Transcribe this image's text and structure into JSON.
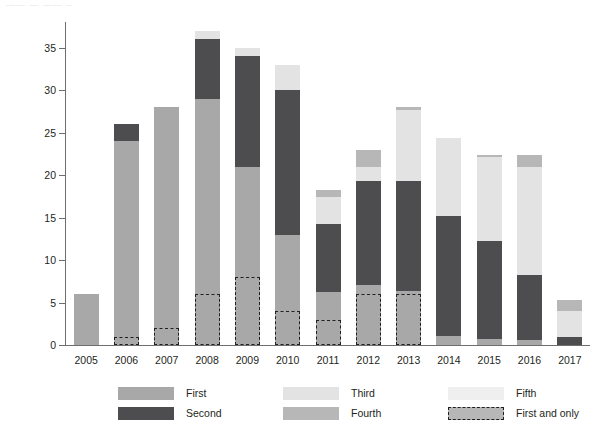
{
  "top_artifact": "—— — ——  ——",
  "axes": {
    "ylabel": "Number of assessments",
    "yticks": [
      0,
      5,
      10,
      15,
      20,
      25,
      30,
      35
    ],
    "ylim": [
      0,
      38
    ],
    "xlabel": ""
  },
  "colors": {
    "first": "#a8a8a8",
    "second": "#4d4d4f",
    "third": "#e3e3e3",
    "fourth": "#b7b7b7",
    "fifth": "#efefef",
    "first_and_only_border": "#231f20",
    "axis": "#6d6e70",
    "text": "#231f20",
    "background": "#ffffff"
  },
  "legend": {
    "items": [
      {
        "label": "First",
        "key": "first",
        "style": "solid"
      },
      {
        "label": "Second",
        "key": "second",
        "style": "solid"
      },
      {
        "label": "Third",
        "key": "third",
        "style": "solid"
      },
      {
        "label": "Fourth",
        "key": "fourth",
        "style": "solid"
      },
      {
        "label": "Fifth",
        "key": "fifth",
        "style": "solid"
      },
      {
        "label": "First and only",
        "key": "fourth",
        "style": "dashed"
      }
    ]
  },
  "chart_data": {
    "type": "bar",
    "subtype": "stacked",
    "title": "",
    "xlabel": "",
    "ylabel": "Number of assessments",
    "ylim": [
      0,
      38
    ],
    "yticks": [
      0,
      5,
      10,
      15,
      20,
      25,
      30,
      35
    ],
    "grid": false,
    "legend_position": "bottom",
    "categories": [
      "2005",
      "2006",
      "2007",
      "2008",
      "2009",
      "2010",
      "2011",
      "2012",
      "2013",
      "2014",
      "2015",
      "2016",
      "2017"
    ],
    "series": [
      {
        "name": "First",
        "values": [
          6,
          24,
          28,
          29,
          21,
          13,
          6.2,
          7.1,
          6.3,
          1.1,
          0.7,
          0.6,
          0
        ]
      },
      {
        "name": "Second",
        "values": [
          0,
          2,
          0,
          7,
          13,
          17,
          8,
          12.2,
          13,
          14.1,
          11.5,
          7.6,
          1
        ]
      },
      {
        "name": "Third",
        "values": [
          0,
          0,
          0,
          1,
          1,
          3,
          3.2,
          1.7,
          8.4,
          9.1,
          9.9,
          12.8,
          3
        ]
      },
      {
        "name": "Fourth",
        "values": [
          0,
          0,
          0,
          0,
          0,
          0,
          0.8,
          2,
          0.3,
          0,
          0.3,
          1.3,
          1.3
        ]
      },
      {
        "name": "Fifth",
        "values": [
          0,
          0,
          0,
          0,
          0,
          0,
          0,
          0,
          0,
          0,
          0,
          0,
          0
        ]
      }
    ],
    "totals": [
      6,
      26,
      28,
      37,
      35,
      33,
      18.2,
      23,
      28,
      24.3,
      22.4,
      22.3,
      5.3
    ],
    "first_and_only": [
      0,
      1,
      2,
      6,
      8,
      4,
      3,
      6,
      6,
      0,
      0,
      0,
      0
    ]
  }
}
